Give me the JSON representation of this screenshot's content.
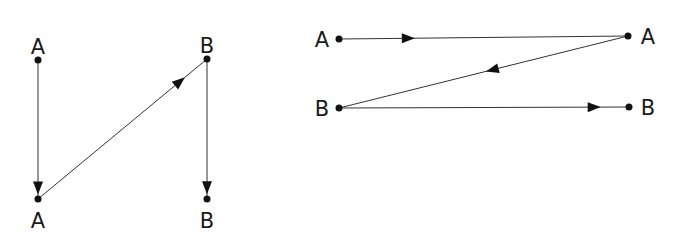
{
  "diagrams": [
    {
      "name": "left-diagram",
      "nodes": [
        {
          "id": "L1",
          "label": "A",
          "x": 38,
          "y": 60,
          "lx": 38,
          "ly": 54
        },
        {
          "id": "L2",
          "label": "A",
          "x": 38,
          "y": 199,
          "lx": 38,
          "ly": 228
        },
        {
          "id": "L3",
          "label": "B",
          "x": 207,
          "y": 59,
          "lx": 207,
          "ly": 53
        },
        {
          "id": "L4",
          "label": "B",
          "x": 207,
          "y": 199,
          "lx": 207,
          "ly": 228
        }
      ],
      "edges": [
        {
          "from": "L1",
          "to": "L2",
          "arrow_t": 0.92
        },
        {
          "from": "L2",
          "to": "L3",
          "arrow_t": 0.84
        },
        {
          "from": "L3",
          "to": "L4",
          "arrow_t": 0.92
        }
      ]
    },
    {
      "name": "right-diagram",
      "nodes": [
        {
          "id": "R1",
          "label": "A",
          "x": 339,
          "y": 39,
          "lx": 322,
          "ly": 47
        },
        {
          "id": "R2",
          "label": "A",
          "x": 628,
          "y": 36,
          "lx": 648,
          "ly": 44
        },
        {
          "id": "R3",
          "label": "B",
          "x": 339,
          "y": 108,
          "lx": 322,
          "ly": 116
        },
        {
          "id": "R4",
          "label": "B",
          "x": 629,
          "y": 107,
          "lx": 648,
          "ly": 115
        }
      ],
      "edges": [
        {
          "from": "R1",
          "to": "R2",
          "arrow_t": 0.24
        },
        {
          "from": "R2",
          "to": "R3",
          "arrow_t": 0.47
        },
        {
          "from": "R3",
          "to": "R4",
          "arrow_t": 0.88
        }
      ]
    }
  ],
  "colors": {
    "line": "#333333",
    "node": "#111111",
    "text": "#1a1a1a"
  }
}
